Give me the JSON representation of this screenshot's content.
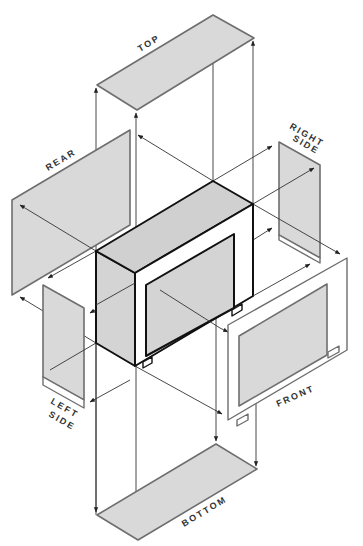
{
  "diagram": {
    "type": "exploded-isometric-view",
    "labels": {
      "top": "TOP",
      "rear": "REAR",
      "right_side_line1": "RIGHT",
      "right_side_line2": "SIDE",
      "left_side_line1": "LEFT",
      "left_side_line2": "SIDE",
      "front": "FRONT",
      "bottom": "BOTTOM"
    },
    "panels": [
      {
        "name": "TOP",
        "position": "above cabinet"
      },
      {
        "name": "REAR",
        "position": "upper left"
      },
      {
        "name": "RIGHT SIDE",
        "position": "upper right"
      },
      {
        "name": "LEFT SIDE",
        "position": "lower left"
      },
      {
        "name": "FRONT",
        "position": "lower right"
      },
      {
        "name": "BOTTOM",
        "position": "below cabinet"
      }
    ],
    "colors": {
      "panel_fill": "#d9d9d9",
      "panel_stroke": "#6e6e6e",
      "box_stroke": "#111111",
      "background": "#ffffff"
    }
  }
}
